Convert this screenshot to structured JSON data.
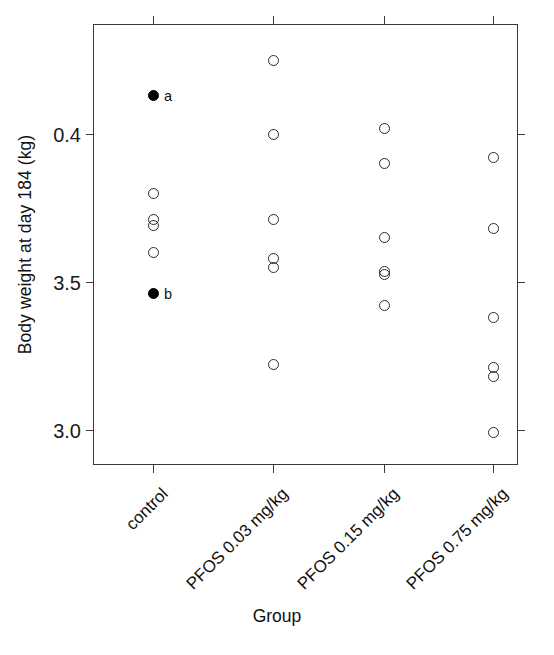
{
  "chart_data": {
    "type": "scatter",
    "title": "",
    "xlabel": "Group",
    "ylabel": "Body weight at day 184 (kg)",
    "categories": [
      "control",
      "PFOS 0.03 mg/kg",
      "PFOS 0.15 mg/kg",
      "PFOS 0.75 mg/kg"
    ],
    "ytick_labels": [
      "0.4",
      "3.5",
      "3.0"
    ],
    "ytick_values": [
      4.0,
      3.5,
      3.0
    ],
    "ylim": [
      2.9,
      4.32
    ],
    "grid": false,
    "legend": null,
    "marker_styles": {
      "open": "open circle",
      "filled": "filled circle"
    },
    "annotations": [
      {
        "text": "a",
        "group": "control",
        "value": 4.13
      },
      {
        "text": "b",
        "group": "control",
        "value": 3.46
      }
    ],
    "series": [
      {
        "name": "control",
        "category_index": 0,
        "points": [
          {
            "value": 4.13,
            "style": "filled",
            "label": "a"
          },
          {
            "value": 3.8,
            "style": "open",
            "label": ""
          },
          {
            "value": 3.71,
            "style": "open",
            "label": ""
          },
          {
            "value": 3.69,
            "style": "open",
            "label": ""
          },
          {
            "value": 3.6,
            "style": "open",
            "label": ""
          },
          {
            "value": 3.46,
            "style": "filled",
            "label": "b"
          }
        ]
      },
      {
        "name": "PFOS 0.03 mg/kg",
        "category_index": 1,
        "points": [
          {
            "value": 4.25,
            "style": "open",
            "label": ""
          },
          {
            "value": 4.0,
            "style": "open",
            "label": ""
          },
          {
            "value": 3.71,
            "style": "open",
            "label": ""
          },
          {
            "value": 3.58,
            "style": "open",
            "label": ""
          },
          {
            "value": 3.55,
            "style": "open",
            "label": ""
          },
          {
            "value": 3.22,
            "style": "open",
            "label": ""
          }
        ]
      },
      {
        "name": "PFOS 0.15 mg/kg",
        "category_index": 2,
        "points": [
          {
            "value": 4.02,
            "style": "open",
            "label": ""
          },
          {
            "value": 3.9,
            "style": "open",
            "label": ""
          },
          {
            "value": 3.65,
            "style": "open",
            "label": ""
          },
          {
            "value": 3.535,
            "style": "open",
            "label": ""
          },
          {
            "value": 3.525,
            "style": "open",
            "label": ""
          },
          {
            "value": 3.42,
            "style": "open",
            "label": ""
          }
        ]
      },
      {
        "name": "PFOS 0.75 mg/kg",
        "category_index": 3,
        "points": [
          {
            "value": 3.92,
            "style": "open",
            "label": ""
          },
          {
            "value": 3.68,
            "style": "open",
            "label": ""
          },
          {
            "value": 3.38,
            "style": "open",
            "label": ""
          },
          {
            "value": 3.21,
            "style": "open",
            "label": ""
          },
          {
            "value": 3.18,
            "style": "open",
            "label": ""
          },
          {
            "value": 2.99,
            "style": "open",
            "label": ""
          }
        ]
      }
    ]
  },
  "axes": {
    "y_title": "Body weight at day 184 (kg)",
    "x_title": "Group"
  },
  "colors": {
    "frame": "#3a3a3a",
    "marker_stroke": "#2b2b2b",
    "marker_fill": "#000000",
    "text": "#101010",
    "background": "#ffffff"
  }
}
